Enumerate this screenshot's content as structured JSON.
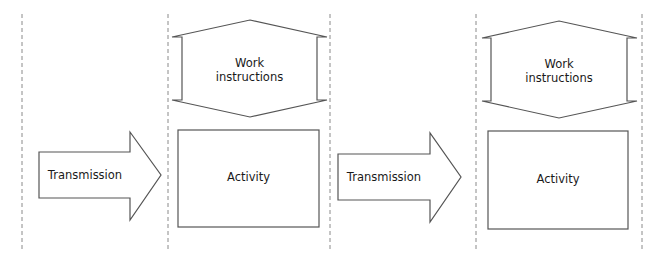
{
  "diagram": {
    "type": "process-flow",
    "colors": {
      "stroke": "#555555",
      "divider": "#8a8a8a",
      "background": "#ffffff",
      "text": "#1a1a1a"
    },
    "lanes": [
      {
        "id": "lane-0"
      },
      {
        "id": "lane-1"
      },
      {
        "id": "lane-2"
      },
      {
        "id": "lane-3"
      }
    ],
    "stages": [
      {
        "transmission": {
          "label": "Transmission"
        },
        "work_instructions": {
          "label_line1": "Work",
          "label_line2": "instructions"
        },
        "activity": {
          "label": "Activity"
        }
      },
      {
        "transmission": {
          "label": "Transmission"
        },
        "work_instructions": {
          "label_line1": "Work",
          "label_line2": "instructions"
        },
        "activity": {
          "label": "Activity"
        }
      }
    ]
  }
}
